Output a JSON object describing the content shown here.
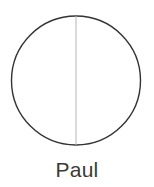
{
  "figure": {
    "caption": "Paul",
    "background_color": "#ffffff"
  },
  "shapes": {
    "circle": {
      "name": "circle-outline",
      "center_x": 76,
      "center_y": 80.5,
      "radius": 64.5,
      "stroke_color": "#333333",
      "stroke_width": 1.4,
      "fill": "none"
    },
    "divider": {
      "name": "vertical-diameter-line",
      "x": 76,
      "y1": 16,
      "y2": 145,
      "stroke_color": "#b5b5b5",
      "stroke_width": 1
    }
  },
  "caption_style": {
    "color": "#3a3a3a",
    "font_size": "21px"
  }
}
